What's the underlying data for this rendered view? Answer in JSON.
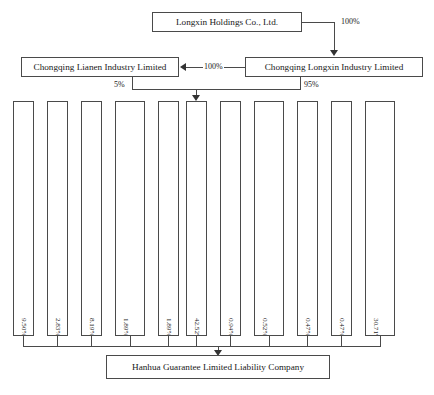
{
  "diagram": {
    "type": "organizational-ownership-chart"
  },
  "top_tier": {
    "holdings": {
      "label": "Longxin Holdings Co., Ltd."
    },
    "lianen": {
      "label": "Chongqing Lianen Industry Limited"
    },
    "longxin_industry": {
      "label": "Chongqing Longxin Industry Limited"
    }
  },
  "edges": {
    "holdings_to_longxin_industry": "100%",
    "longxin_industry_to_lianen": "100%",
    "lianen_to_hanhua_guarantee": "5%",
    "longxin_industry_to_hanhua_guarantee": "95%"
  },
  "shareholders": [
    {
      "name": "Chongqing Huitai Investment Co., Ltd",
      "percent": "9.50%"
    },
    {
      "name": "Chongqing Boxin Investment Co., Ltd",
      "percent": "2.83%"
    },
    {
      "name": "Chongqing Jiulong Metal Recycling Co., Ltd",
      "percent": "8.19%"
    },
    {
      "name": "Xinjiang Bocang Equity Investment Fund Partnership",
      "percent": "1.89%"
    },
    {
      "name": "Chongqing Puzhaobiology Investment Co., Ltd.",
      "percent": "1.89%"
    },
    {
      "name": "Hanhua Guarantee Co., Ltd",
      "percent": "42.52%"
    },
    {
      "name": "Chongqing Jicheng Assets Management Ltd.",
      "percent": "0.94%"
    },
    {
      "name": "Shenyang Yicheng Union Science and Technology Ltd.",
      "percent": "0.52%"
    },
    {
      "name": "Zhongjuan Investment Co., Ltd.",
      "percent": "0.47%"
    },
    {
      "name": "Expeditors International of Shanxi Hengtiancheng",
      "percent": "0.47%"
    },
    {
      "name": "Wang Mingyue and other 18 natural person shareholders",
      "percent": "30.71%"
    }
  ],
  "bottom_tier": {
    "hanhua_llc": {
      "label": "Hanhua Guarantee Limited Liability Company"
    }
  },
  "colors": {
    "border": "#4a4a4a",
    "arrow": "#333333",
    "text": "#1a1a1a",
    "background": "#ffffff"
  }
}
